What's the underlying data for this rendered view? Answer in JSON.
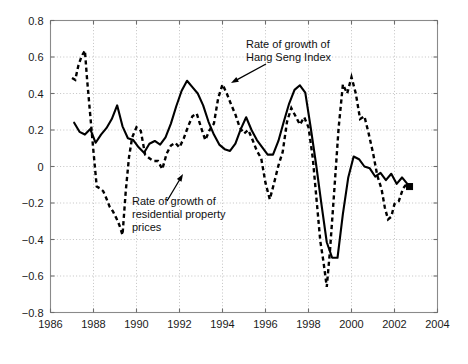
{
  "chart_data": {
    "type": "line",
    "title": "",
    "subtitle": "",
    "xlabel": "",
    "ylabel": "",
    "xlim": [
      1986,
      2004
    ],
    "ylim": [
      -0.8,
      0.8
    ],
    "grid": true,
    "legend_position": "inline-annotations",
    "x_ticks": [
      "1986",
      "1988",
      "1990",
      "1992",
      "1994",
      "1996",
      "1998",
      "2000",
      "2002",
      "2004"
    ],
    "x_tick_values": [
      1986,
      1988,
      1990,
      1992,
      1994,
      1996,
      1998,
      2000,
      2002,
      2004
    ],
    "y_ticks": [
      "0.8",
      "0.6",
      "0.4",
      "0.2",
      "0",
      "-0.2",
      "-0.4",
      "-0.6",
      "-0.8"
    ],
    "y_tick_values": [
      0.8,
      0.6,
      0.4,
      0.2,
      0,
      -0.2,
      -0.4,
      -0.6,
      -0.8
    ],
    "series": [
      {
        "name": "Rate of growth of residential property prices",
        "style": "solid",
        "color": "#000000",
        "end_marker": "square",
        "x": [
          1987.1,
          1987.35,
          1987.6,
          1987.85,
          1988.1,
          1988.35,
          1988.6,
          1988.85,
          1989.1,
          1989.35,
          1989.6,
          1989.85,
          1990.1,
          1990.35,
          1990.6,
          1990.85,
          1991.1,
          1991.35,
          1991.6,
          1991.85,
          1992.1,
          1992.35,
          1992.6,
          1992.85,
          1993.1,
          1993.35,
          1993.6,
          1993.85,
          1994.1,
          1994.35,
          1994.6,
          1994.85,
          1995.1,
          1995.35,
          1995.6,
          1995.85,
          1996.1,
          1996.35,
          1996.6,
          1996.85,
          1997.1,
          1997.35,
          1997.6,
          1997.85,
          1998.1,
          1998.35,
          1998.6,
          1998.85,
          1999.1,
          1999.35,
          1999.6,
          1999.85,
          2000.1,
          2000.35,
          2000.6,
          2000.85,
          2001.1,
          2001.35,
          2001.6,
          2001.85,
          2002.1,
          2002.35,
          2002.7
        ],
        "y": [
          0.24,
          0.19,
          0.175,
          0.205,
          0.13,
          0.175,
          0.21,
          0.26,
          0.335,
          0.22,
          0.155,
          0.145,
          0.105,
          0.075,
          0.125,
          0.14,
          0.12,
          0.16,
          0.235,
          0.33,
          0.415,
          0.47,
          0.435,
          0.4,
          0.335,
          0.245,
          0.175,
          0.12,
          0.095,
          0.085,
          0.125,
          0.205,
          0.27,
          0.2,
          0.145,
          0.105,
          0.065,
          0.065,
          0.14,
          0.245,
          0.345,
          0.42,
          0.445,
          0.405,
          0.215,
          0.015,
          -0.205,
          -0.415,
          -0.5,
          -0.5,
          -0.26,
          -0.06,
          0.055,
          0.04,
          0.0,
          -0.01,
          -0.055,
          -0.035,
          -0.075,
          -0.04,
          -0.095,
          -0.06,
          -0.11
        ]
      },
      {
        "name": "Rate of growth of Hang Seng Index",
        "style": "dashed",
        "color": "#000000",
        "end_marker": "none",
        "x": [
          1987.0,
          1987.15,
          1987.3,
          1987.45,
          1987.6,
          1987.7,
          1987.85,
          1988.0,
          1988.15,
          1988.3,
          1988.45,
          1988.6,
          1988.75,
          1988.9,
          1989.05,
          1989.2,
          1989.35,
          1989.5,
          1989.65,
          1989.8,
          1990.0,
          1990.2,
          1990.4,
          1990.6,
          1990.8,
          1991.0,
          1991.2,
          1991.4,
          1991.6,
          1991.8,
          1992.0,
          1992.2,
          1992.4,
          1992.6,
          1992.8,
          1993.0,
          1993.2,
          1993.4,
          1993.6,
          1993.8,
          1994.0,
          1994.2,
          1994.4,
          1994.6,
          1994.8,
          1995.0,
          1995.2,
          1995.4,
          1995.6,
          1995.8,
          1996.0,
          1996.2,
          1996.4,
          1996.6,
          1996.8,
          1997.0,
          1997.2,
          1997.4,
          1997.6,
          1997.8,
          1998.0,
          1998.2,
          1998.4,
          1998.55,
          1998.7,
          1998.85,
          1999.0,
          1999.2,
          1999.4,
          1999.6,
          1999.8,
          2000.0,
          2000.2,
          2000.4,
          2000.6,
          2000.8,
          2001.0,
          2001.2,
          2001.4,
          2001.55,
          2001.7,
          2001.85,
          2002.0,
          2002.2,
          2002.4,
          2002.6
        ],
        "y": [
          0.485,
          0.475,
          0.555,
          0.605,
          0.635,
          0.48,
          0.28,
          0.08,
          -0.11,
          -0.12,
          -0.135,
          -0.175,
          -0.22,
          -0.245,
          -0.28,
          -0.32,
          -0.375,
          -0.135,
          0.05,
          0.16,
          0.215,
          0.195,
          0.065,
          0.045,
          0.03,
          0.03,
          -0.015,
          0.07,
          0.115,
          0.13,
          0.105,
          0.155,
          0.22,
          0.275,
          0.29,
          0.215,
          0.145,
          0.2,
          0.235,
          0.375,
          0.45,
          0.4,
          0.34,
          0.285,
          0.215,
          0.18,
          0.2,
          0.145,
          0.085,
          0.045,
          -0.09,
          -0.18,
          -0.09,
          0.005,
          0.08,
          0.245,
          0.32,
          0.275,
          0.23,
          0.27,
          0.215,
          0.045,
          -0.215,
          -0.41,
          -0.525,
          -0.66,
          -0.46,
          -0.13,
          0.21,
          0.45,
          0.4,
          0.49,
          0.4,
          0.26,
          0.275,
          0.18,
          0.075,
          -0.05,
          -0.125,
          -0.225,
          -0.29,
          -0.275,
          -0.205,
          -0.19,
          -0.12,
          -0.09
        ]
      }
    ],
    "annotations": [
      {
        "id": "hang-seng-annotation",
        "lines": [
          "Rate of growth of",
          "Hang Seng Index"
        ],
        "text_x": 246,
        "text_y": 48,
        "arrow_from_x": 266,
        "arrow_from_y": 64,
        "arrow_to_x": 231,
        "arrow_to_y": 83
      },
      {
        "id": "property-prices-annotation",
        "lines": [
          "Rate of growth of",
          "residential property",
          "prices"
        ],
        "text_x": 132,
        "text_y": 205,
        "arrow_from_x": 167,
        "arrow_from_y": 201,
        "arrow_to_x": 183,
        "arrow_to_y": 174
      }
    ],
    "colors": {
      "line": "#000000",
      "grid": "#b4b4b4",
      "axis": "#8a8a8a",
      "text": "#111111",
      "background": "#ffffff"
    }
  }
}
